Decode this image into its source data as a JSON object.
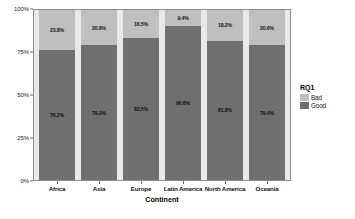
{
  "chart_data": {
    "type": "bar",
    "title": "",
    "subtitle": "",
    "xlabel": "Continent",
    "ylabel": "",
    "stacked": true,
    "normalized_percent": true,
    "ylim": [
      0,
      100
    ],
    "ytick_labels": [
      "0%",
      "25%",
      "50%",
      "75%",
      "100%"
    ],
    "ytick_values": [
      0,
      25,
      50,
      75,
      100
    ],
    "grid": false,
    "legend_position": "right",
    "legend_title": "RQ1",
    "categories": [
      "Africa",
      "Asia",
      "Europe",
      "Latin America",
      "North America",
      "Oceania"
    ],
    "series": [
      {
        "name": "Bad",
        "color": "#bfbfbf",
        "values": [
          23.8,
          20.8,
          16.5,
          9.4,
          18.2,
          20.6
        ],
        "labels": [
          "23.8%",
          "20.8%",
          "16.5%",
          "9.4%",
          "18.2%",
          "20.6%"
        ]
      },
      {
        "name": "Good",
        "color": "#6f6f6f",
        "values": [
          76.2,
          79.2,
          83.5,
          90.6,
          81.8,
          79.4
        ],
        "labels": [
          "76.2%",
          "79.2%",
          "83.5%",
          "90.6%",
          "81.8%",
          "79.4%"
        ]
      }
    ],
    "plot_background_color": "#e9e9e9",
    "figure_background_color": "#ffffff",
    "axis_line_color": "#8d8d8d"
  }
}
